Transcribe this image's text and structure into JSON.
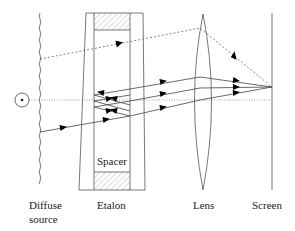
{
  "diagram": {
    "labels": {
      "spacer": "Spacer",
      "diffuse": "Diffuse",
      "source": "source",
      "etalon": "Etalon",
      "lens": "Lens",
      "screen": "Screen"
    },
    "components": [
      "point-source",
      "diffuse-source",
      "etalon",
      "spacer",
      "lens",
      "screen",
      "optical-axis"
    ],
    "colors": {
      "line": "#555555",
      "hatch": "#bbbbbb",
      "arrow": "#000000"
    }
  }
}
